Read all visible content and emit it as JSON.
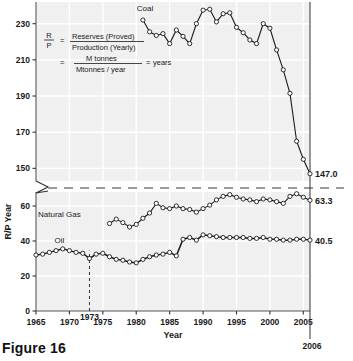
{
  "figure": {
    "caption": "Figure 16",
    "background": "#f0f0f0",
    "gridline_color": "#ffffff",
    "line_color": "#1a1a1a",
    "break_line_color": "#9a9a9a"
  },
  "axes": {
    "ylabel": "R/P Year",
    "xlabel": "Year",
    "upper_ticks": [
      150,
      170,
      190,
      210,
      230
    ],
    "lower_ticks": [
      0,
      20,
      40,
      60
    ],
    "upper_range": [
      143,
      242
    ],
    "lower_range": [
      0,
      68
    ],
    "x_ticks": [
      1965,
      1970,
      1975,
      1980,
      1985,
      1990,
      1995,
      2000,
      2005
    ],
    "x_range": [
      1965,
      2006
    ],
    "marker_year_label": "1973",
    "marker_year": 1973,
    "edge_year_label": "2006",
    "edge_year": 2006
  },
  "formula": {
    "ratio_numerator": "R",
    "ratio_denominator": "P",
    "equals": "=",
    "line1_numerator": "Reserves (Proved)",
    "line1_denominator": "Production (Yearly)",
    "equals2": "=",
    "line2_numerator": "M tonnes",
    "line2_denominator": "Mtonnes / year",
    "equals3": "=",
    "result": "years"
  },
  "chart_data": {
    "type": "line",
    "title": "",
    "xlabel": "Year",
    "ylabel": "R/P Year",
    "grid": true,
    "legend": "inline-labels",
    "xlim": [
      1965,
      2006
    ],
    "ylim_upper": [
      143,
      242
    ],
    "ylim_lower": [
      0,
      68
    ],
    "axis_break": {
      "below": 150,
      "above": 68,
      "style": "dashed"
    },
    "series": [
      {
        "name": "Coal",
        "label": "Coal",
        "end_value_label": "147.0",
        "panel": "upper",
        "x": [
          1981,
          1982,
          1983,
          1984,
          1985,
          1986,
          1987,
          1988,
          1989,
          1990,
          1991,
          1992,
          1993,
          1994,
          1995,
          1996,
          1997,
          1998,
          1999,
          2000,
          2001,
          2002,
          2003,
          2004,
          2005,
          2006
        ],
        "values": [
          232.0,
          225.5,
          223.5,
          224.5,
          219.0,
          226.5,
          223.0,
          219.0,
          230.0,
          237.5,
          238.0,
          231.0,
          235.5,
          236.0,
          228.0,
          225.0,
          221.0,
          219.0,
          230.0,
          227.5,
          215.5,
          204.5,
          191.5,
          165.0,
          155.0,
          147.0
        ]
      },
      {
        "name": "Natural Gas",
        "label": "Natural Gas",
        "end_value_label": "63.3",
        "panel": "lower",
        "x": [
          1976,
          1977,
          1978,
          1979,
          1980,
          1981,
          1982,
          1983,
          1984,
          1985,
          1986,
          1987,
          1988,
          1989,
          1990,
          1991,
          1992,
          1993,
          1994,
          1995,
          1996,
          1997,
          1998,
          1999,
          2000,
          2001,
          2002,
          2003,
          2004,
          2005,
          2006
        ],
        "values": [
          50.0,
          52.5,
          50.5,
          48.0,
          49.5,
          53.0,
          56.0,
          61.5,
          59.0,
          58.5,
          60.0,
          58.5,
          58.0,
          56.5,
          58.5,
          60.5,
          63.5,
          65.5,
          66.5,
          65.0,
          64.0,
          63.5,
          62.5,
          64.0,
          63.5,
          62.5,
          61.5,
          65.5,
          67.0,
          65.0,
          63.3
        ]
      },
      {
        "name": "Oil",
        "label": "Oil",
        "end_value_label": "40.5",
        "panel": "lower",
        "x": [
          1965,
          1966,
          1967,
          1968,
          1969,
          1970,
          1971,
          1972,
          1973,
          1974,
          1975,
          1976,
          1977,
          1978,
          1979,
          1980,
          1981,
          1982,
          1983,
          1984,
          1985,
          1986,
          1987,
          1988,
          1989,
          1990,
          1991,
          1992,
          1993,
          1994,
          1995,
          1996,
          1997,
          1998,
          1999,
          2000,
          2001,
          2002,
          2003,
          2004,
          2005,
          2006
        ],
        "values": [
          32.0,
          32.5,
          33.5,
          34.5,
          35.5,
          34.5,
          33.5,
          33.0,
          30.0,
          32.5,
          33.0,
          31.0,
          29.5,
          29.0,
          28.0,
          27.5,
          29.5,
          31.0,
          32.0,
          32.5,
          33.5,
          31.5,
          41.0,
          42.0,
          40.5,
          43.5,
          43.0,
          42.5,
          42.0,
          42.0,
          42.0,
          42.0,
          41.5,
          41.5,
          42.0,
          41.0,
          41.0,
          40.5,
          40.5,
          41.0,
          41.0,
          40.5
        ]
      }
    ]
  }
}
